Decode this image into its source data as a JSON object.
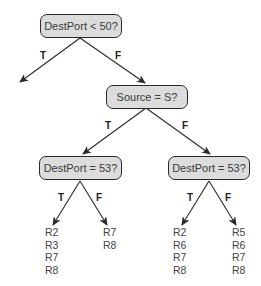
{
  "diagram": {
    "type": "decision-tree",
    "nodes": {
      "root": "DestPort < 50?",
      "source": "Source = S?",
      "left_dest": "DestPort = 53?",
      "right_dest": "DestPort = 53?"
    },
    "edge_labels": {
      "root_true": "T",
      "root_false": "F",
      "source_true": "T",
      "source_false": "F",
      "left_dest_true": "T",
      "left_dest_false": "F",
      "right_dest_true": "T",
      "right_dest_false": "F"
    },
    "leaves": {
      "left_true": [
        "R2",
        "R3",
        "R7",
        "R8"
      ],
      "left_false": [
        "R7",
        "R8"
      ],
      "right_true": [
        "R2",
        "R6",
        "R7",
        "R8"
      ],
      "right_false": [
        "R5",
        "R6",
        "R7",
        "R8"
      ]
    },
    "colors": {
      "node_fill": "#dcdcdc",
      "node_border": "#2a2a2a",
      "edge": "#2a2a2a"
    }
  }
}
